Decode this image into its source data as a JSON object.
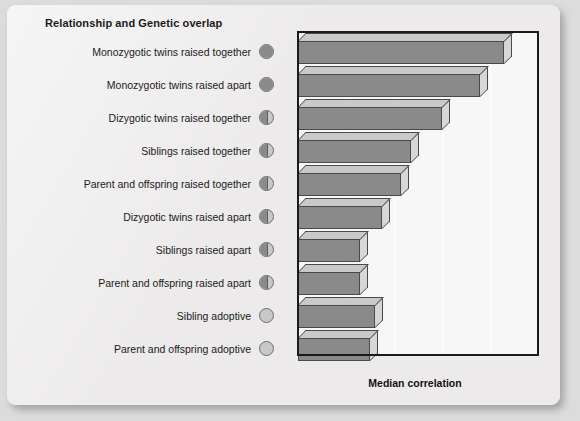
{
  "chart_data": {
    "type": "bar",
    "orientation": "horizontal",
    "title": "Relationship and Genetic overlap",
    "xlabel": "Median correlation",
    "ylabel": "",
    "xlim": [
      0.0,
      1.0
    ],
    "xticks": [
      ".00",
      ".20",
      ".40",
      ".60",
      ".80",
      "1.00"
    ],
    "xtick_values": [
      0.0,
      0.2,
      0.4,
      0.6,
      0.8,
      1.0
    ],
    "grid": true,
    "legend": "none",
    "categories": [
      "Monozygotic twins raised together",
      "Monozygotic twins raised apart",
      "Dizygotic twins raised together",
      "Siblings raised together",
      "Parent and offspring raised together",
      "Dizygotic twins raised apart",
      "Siblings raised apart",
      "Parent and offspring raised apart",
      "Sibling adoptive",
      "Parent and offspring adoptive"
    ],
    "values": [
      0.86,
      0.76,
      0.6,
      0.47,
      0.43,
      0.35,
      0.26,
      0.26,
      0.32,
      0.3
    ],
    "genetic_overlap": [
      1.0,
      1.0,
      0.5,
      0.5,
      0.5,
      0.5,
      0.5,
      0.5,
      0.0,
      0.0
    ]
  },
  "rows": [
    {
      "label": "Monozygotic twins raised together",
      "value": 0.86,
      "overlap": 1.0
    },
    {
      "label": "Monozygotic twins raised apart",
      "value": 0.76,
      "overlap": 1.0
    },
    {
      "label": "Dizygotic twins raised together",
      "value": 0.6,
      "overlap": 0.5
    },
    {
      "label": "Siblings raised together",
      "value": 0.47,
      "overlap": 0.5
    },
    {
      "label": "Parent and offspring raised together",
      "value": 0.43,
      "overlap": 0.5
    },
    {
      "label": "Dizygotic twins raised apart",
      "value": 0.35,
      "overlap": 0.5
    },
    {
      "label": "Siblings raised apart",
      "value": 0.26,
      "overlap": 0.5
    },
    {
      "label": "Parent and offspring raised apart",
      "value": 0.26,
      "overlap": 0.5
    },
    {
      "label": "Sibling adoptive",
      "value": 0.32,
      "overlap": 0.0
    },
    {
      "label": "Parent and offspring adoptive",
      "value": 0.3,
      "overlap": 0.0
    }
  ],
  "colors": {
    "bar_front": "#8a8a8a",
    "bar_top": "#c9c9c9",
    "bar_side": "#d7d7d7",
    "bar_edge": "#4a4a4a",
    "plot_bg": "#f7f7f7",
    "card_bg": "#eceaea",
    "page_bg": "#dcdcdc",
    "axis": "#1a1a1a",
    "overlap_filled": "#8a8a8a",
    "overlap_empty": "#c8c8c8"
  }
}
